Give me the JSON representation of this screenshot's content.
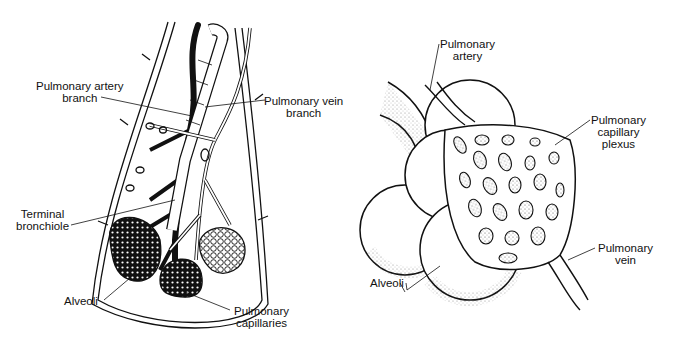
{
  "figure": {
    "left_panel": {
      "name": "Lung lobule with bronchiole and vessels",
      "labels": {
        "pulmonary_artery_branch": [
          "Pulmonary artery",
          "branch"
        ],
        "pulmonary_vein_branch": [
          "Pulmonary vein",
          "branch"
        ],
        "terminal_bronchiole": [
          "Terminal",
          "bronchiole"
        ],
        "alveoli": [
          "Alveoli"
        ],
        "pulmonary_capillaries": [
          "Pulmonary",
          "capillaries"
        ]
      }
    },
    "right_panel": {
      "name": "Alveoli with pulmonary capillary plexus",
      "labels": {
        "pulmonary_artery": [
          "Pulmonary",
          "artery"
        ],
        "pulmonary_capillary_plexus": [
          "Pulmonary",
          "capillary",
          "plexus"
        ],
        "alveoli": [
          "Alveoli"
        ],
        "pulmonary_vein": [
          "Pulmonary",
          "vein"
        ]
      }
    },
    "colors": {
      "ink": "#111111",
      "background": "#ffffff",
      "stipple": "#555555"
    }
  }
}
